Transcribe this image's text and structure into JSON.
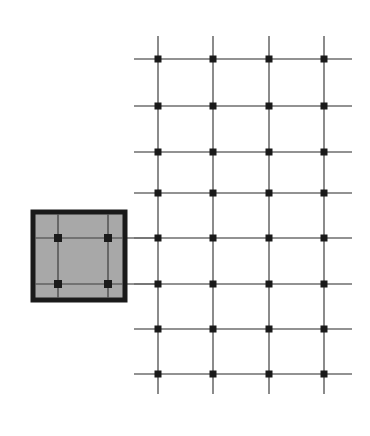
{
  "figure": {
    "title": "",
    "background_color": "#ffffff",
    "line_color": "#6e6e6e",
    "node_color": "#1a1a1a",
    "inset_fill_color": "#a8a8a8",
    "inset_border_color": "#1a1a1a",
    "inset_gridline_color": "#3c3c3c"
  },
  "chart_data": {
    "type": "scatter",
    "title": "",
    "xlabel": "",
    "ylabel": "",
    "grid": true,
    "legend": null,
    "lattice": {
      "name": "main-lattice",
      "columns": 4,
      "rows": 8,
      "column_x": [
        158,
        213,
        269,
        324
      ],
      "row_y": [
        59,
        106,
        152,
        193,
        238,
        284,
        329,
        374
      ],
      "column_spacing": 55,
      "row_spacing": 45,
      "horizontal_line_extent": [
        134,
        352
      ],
      "vertical_line_extent": [
        36,
        394
      ],
      "node_size": 7,
      "line_width": 1.6
    },
    "inset": {
      "name": "magnified-inset",
      "x": 33,
      "y": 212,
      "width": 92,
      "height": 88,
      "border_width": 5,
      "columns": 2,
      "rows": 2,
      "node_x": [
        58,
        108
      ],
      "node_y": [
        238,
        284
      ],
      "node_size": 8,
      "gridline_width": 1.2
    },
    "callout_lines": [
      {
        "name": "callout-upper",
        "x1": 125,
        "y1": 238,
        "x2": 158,
        "y2": 238
      },
      {
        "name": "callout-lower",
        "x1": 125,
        "y1": 284,
        "x2": 158,
        "y2": 284
      }
    ]
  }
}
